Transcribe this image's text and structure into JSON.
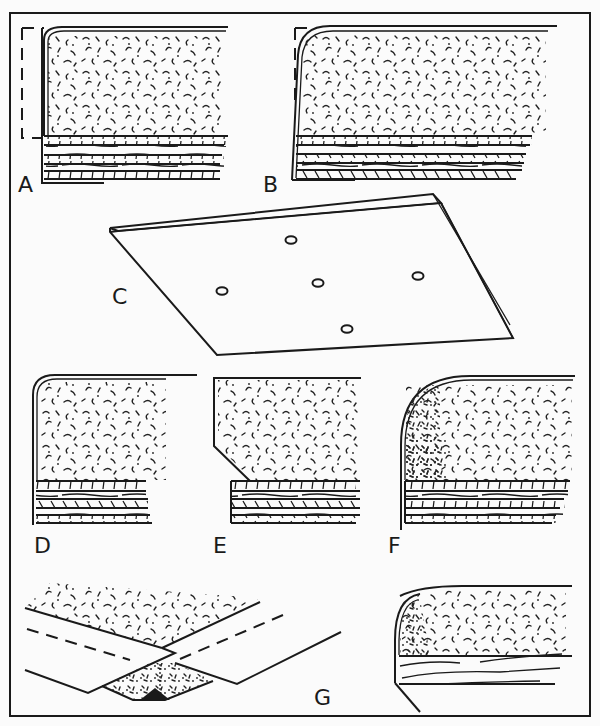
{
  "figure": {
    "panels": [
      {
        "id": "A",
        "label": "A",
        "content": "Rounded-edge foam cushion over layered base, dashed outline at left/top corner"
      },
      {
        "id": "B",
        "label": "B",
        "content": "Slanted-edge foam cushion over layered base, dashed corner outline"
      },
      {
        "id": "C",
        "label": "C",
        "content": "Perspective view of flat board with five small holes"
      },
      {
        "id": "D",
        "label": "D",
        "content": "Rounded-edge cushion over layered base"
      },
      {
        "id": "E",
        "label": "E",
        "content": "Chamfered-edge cushion over layered base"
      },
      {
        "id": "F",
        "label": "F",
        "content": "Large-radius rounded edge with denser filling near edge"
      },
      {
        "id": "G",
        "label": "G",
        "content": "Perspective view of fold/joint with dashed fold lines and filled seam"
      },
      {
        "id": "G2",
        "label": "",
        "content": "Rounded-edge cushion over single wood-grain base with angled lower edge"
      }
    ]
  },
  "colors": {
    "background": "#fbfbfb",
    "ink": "#1a1a1a"
  }
}
